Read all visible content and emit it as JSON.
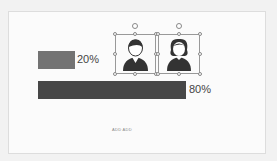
{
  "slide": {
    "bars": [
      {
        "label": "20%",
        "color": "#737373"
      },
      {
        "label": "80%",
        "color": "#474747"
      }
    ],
    "icons": [
      {
        "name": "male-person-icon"
      },
      {
        "name": "female-person-icon"
      }
    ],
    "footer_text": "ADD ADD"
  }
}
